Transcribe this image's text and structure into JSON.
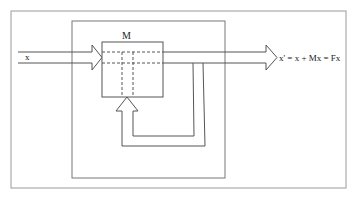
{
  "diagram": {
    "type": "block-diagram",
    "colors": {
      "stroke": "#555555",
      "frame": "#999999",
      "background": "#ffffff"
    },
    "input_label": "x",
    "block_label": "M",
    "output_label": "x' = x + Mx = Fx",
    "elements": [
      {
        "id": "outer-frame",
        "shape": "rectangle"
      },
      {
        "id": "inner-frame",
        "shape": "rectangle"
      },
      {
        "id": "input-arrow",
        "shape": "hollow-arrow",
        "direction": "right",
        "label": "x"
      },
      {
        "id": "block-m",
        "shape": "rectangle",
        "label": "M"
      },
      {
        "id": "output-arrow",
        "shape": "hollow-arrow",
        "direction": "right",
        "label": "x' = x + Mx = Fx"
      },
      {
        "id": "feedback-loop",
        "shape": "hollow-arrow",
        "direction": "up",
        "into": "block-m"
      }
    ]
  }
}
